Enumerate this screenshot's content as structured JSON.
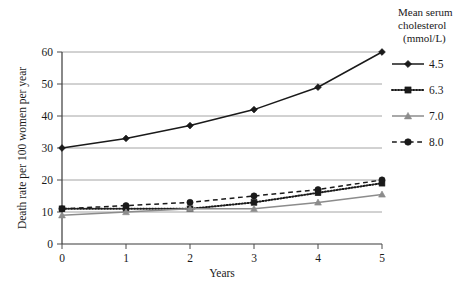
{
  "chart_data": {
    "type": "line",
    "title": "",
    "xlabel": "Years",
    "ylabel": "Death rate per 100 women per year",
    "x": [
      0,
      1,
      2,
      3,
      4,
      5
    ],
    "xticklabels": [
      "0",
      "1",
      "2",
      "3",
      "4",
      "5"
    ],
    "yticklabels": [
      "0",
      "10",
      "20",
      "30",
      "40",
      "50",
      "60"
    ],
    "yticks": [
      0,
      10,
      20,
      30,
      40,
      50,
      60
    ],
    "xlim": [
      0,
      5
    ],
    "ylim": [
      0,
      60
    ],
    "grid": "horizontal",
    "legend_position": "right",
    "legend_title": [
      "Mean serum",
      "cholesterol",
      "(mmol/L)"
    ],
    "series": [
      {
        "name": "4.5",
        "marker": "diamond",
        "linestyle": "solid",
        "color": "#1a1a1a",
        "values": [
          30,
          33,
          37,
          42,
          49,
          60
        ]
      },
      {
        "name": "6.3",
        "marker": "square",
        "linestyle": "dotted",
        "color": "#1a1a1a",
        "values": [
          11,
          11,
          11,
          13,
          16,
          19
        ]
      },
      {
        "name": "7.0",
        "marker": "triangle",
        "linestyle": "solid",
        "color": "#8c8c8c",
        "values": [
          9,
          10,
          11,
          11,
          13,
          15.5
        ]
      },
      {
        "name": "8.0",
        "marker": "circle",
        "linestyle": "dashed",
        "color": "#1a1a1a",
        "values": [
          11,
          12,
          13,
          15,
          17,
          20
        ]
      }
    ]
  },
  "axes": {
    "x_title": "Years",
    "y_title": "Death rate per 100 women per year"
  },
  "legend": {
    "title_line1": "Mean serum",
    "title_line2": "cholesterol",
    "title_line3": "(mmol/L)",
    "entries": [
      {
        "label": "4.5"
      },
      {
        "label": "6.3"
      },
      {
        "label": "7.0"
      },
      {
        "label": "8.0"
      }
    ]
  },
  "ticks": {
    "y": [
      "60",
      "50",
      "40",
      "30",
      "20",
      "10",
      "0"
    ],
    "x": [
      "0",
      "1",
      "2",
      "3",
      "4",
      "5"
    ]
  }
}
